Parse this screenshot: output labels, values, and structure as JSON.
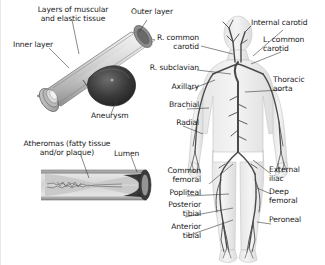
{
  "figure": {
    "background_color": "#ffffff",
    "text_color": "#1a1a1a"
  },
  "aneurysm_diagram": {
    "name": "aneurysm-cutaway-illustration",
    "labels": {
      "layers": "Layers of muscular\nand elastic tissue",
      "inner_layer": "Inner layer",
      "outer_layer": "Outer layer",
      "aneurysm": "Aneurysm"
    }
  },
  "atheroma_diagram": {
    "name": "atheroma-vessel-illustration",
    "labels": {
      "atheromas": "Atheromas (fatty tissue\nand/or plaque)",
      "lumen": "Lumen"
    }
  },
  "body_diagram": {
    "name": "arterial-body-illustration",
    "left_labels": [
      {
        "id": "r-common-carotid",
        "text": "R. common\ncarotid"
      },
      {
        "id": "r-subclavian",
        "text": "R. subclavian"
      },
      {
        "id": "axillary",
        "text": "Axillary"
      },
      {
        "id": "brachial",
        "text": "Brachial"
      },
      {
        "id": "radial",
        "text": "Radial"
      },
      {
        "id": "common-femoral",
        "text": "Common\nfemoral"
      },
      {
        "id": "popliteal",
        "text": "Popliteal"
      },
      {
        "id": "posterior-tibial",
        "text": "Posterior\ntibial"
      },
      {
        "id": "anterior-tibial",
        "text": "Anterior\ntibial"
      }
    ],
    "right_labels": [
      {
        "id": "internal-carotid",
        "text": "Internal carotid"
      },
      {
        "id": "l-common-carotid",
        "text": "L. common\ncarotid"
      },
      {
        "id": "thoracic-aorta",
        "text": "Thoracic\naorta"
      },
      {
        "id": "external-iliac",
        "text": "External\niliac"
      },
      {
        "id": "deep-femoral",
        "text": "Deep\nfemoral"
      },
      {
        "id": "peroneal",
        "text": "Peroneal"
      }
    ]
  }
}
